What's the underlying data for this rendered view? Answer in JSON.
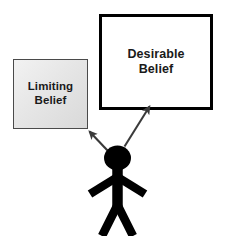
{
  "diagram": {
    "background_color": "#ffffff",
    "ink_color": "#000000"
  },
  "boxes": [
    {
      "id": "limiting",
      "label": "Limiting\nBelief",
      "line1": "Limiting",
      "line2": "Belief",
      "fill_color": "#e6e6e6",
      "border_color": "#4a4a4a",
      "style": "grey gradient, thin border"
    },
    {
      "id": "desirable",
      "label": "Desirable\nBelief",
      "line1": "Desirable",
      "line2": "Belief",
      "fill_color": "#ffffff",
      "border_color": "#000000",
      "style": "white fill, thick border"
    }
  ],
  "arrows": [
    {
      "id": "arrow-to-limiting",
      "from": "stick-figure",
      "to": "limiting",
      "direction": "up-left",
      "color": "#3a3a3a"
    },
    {
      "id": "arrow-to-desirable",
      "from": "stick-figure",
      "to": "desirable",
      "direction": "up-right",
      "color": "#3a3a3a"
    }
  ],
  "figure": {
    "id": "stick-figure",
    "name": "person",
    "color": "#000000"
  }
}
